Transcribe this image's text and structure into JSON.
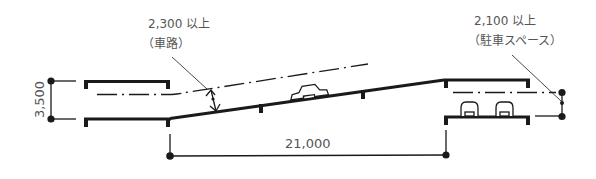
{
  "diagram": {
    "colors": {
      "line": "#1a1a1a",
      "text": "#555555",
      "background": "#ffffff"
    },
    "labels": {
      "ramp_clearance_value": "2,300 以上",
      "ramp_clearance_note": "（車路）",
      "parking_clearance_value": "2,100 以上",
      "parking_clearance_note": "（駐車スペース）",
      "floor_height": "3,500",
      "ramp_length": "21,000"
    },
    "elements": {
      "car_icon_ramp": "car-side-icon",
      "car_icons_parking": [
        "car-front-icon",
        "car-front-icon"
      ]
    }
  }
}
